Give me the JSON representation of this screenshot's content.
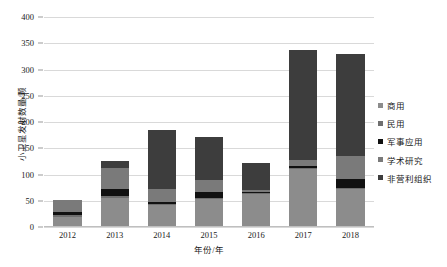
{
  "chart_data": {
    "type": "bar",
    "stacked": true,
    "title": "",
    "xlabel": "年份/年",
    "ylabel": "小卫星发射数量/颗",
    "categories": [
      "2012",
      "2013",
      "2014",
      "2015",
      "2016",
      "2017",
      "2018"
    ],
    "ylim": [
      0,
      400
    ],
    "yticks": [
      0,
      50,
      100,
      150,
      200,
      250,
      300,
      350,
      400
    ],
    "grid": true,
    "legend_position": "right",
    "series": [
      {
        "name": "商用",
        "color": "#8c8c8c",
        "values": [
          20,
          56,
          41,
          53,
          62,
          110,
          73
        ]
      },
      {
        "name": "民用",
        "color": "#6f6f6f",
        "values": [
          2,
          3,
          2,
          2,
          2,
          2,
          2
        ]
      },
      {
        "name": "军事应用",
        "color": "#111111",
        "values": [
          7,
          13,
          5,
          12,
          2,
          5,
          16
        ]
      },
      {
        "name": "学术研究",
        "color": "#7a7a7a",
        "values": [
          23,
          41,
          24,
          22,
          5,
          11,
          45
        ]
      },
      {
        "name": "非营利组织",
        "color": "#3d3d3d",
        "values": [
          0,
          13,
          113,
          83,
          50,
          209,
          193
        ]
      }
    ],
    "totals": [
      52,
      126,
      185,
      172,
      121,
      337,
      329
    ]
  },
  "axis": {
    "y_title": "小卫星发射数量/颗",
    "x_title": "年份/年"
  }
}
